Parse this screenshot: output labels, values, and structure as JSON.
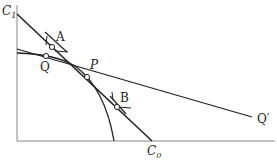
{
  "labels": {
    "c1": "C",
    "c1_sub": "1",
    "c0": "C",
    "c0_sub": "0",
    "a": "A",
    "q": "Q",
    "p": "P",
    "b": "B",
    "q_prime": "Q′"
  },
  "colors": {
    "line": "#222222",
    "axis": "#888888"
  }
}
